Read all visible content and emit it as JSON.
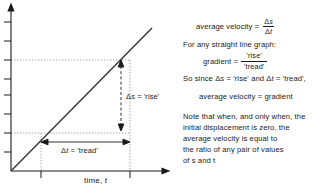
{
  "graph": {
    "x_axis_label": "time, ",
    "x_axis_label_var": "t",
    "rise_annotation_pre": "Δ",
    "rise_annotation_var": "s",
    "rise_annotation_post": " = 'rise'",
    "tread_annotation_pre": "Δ",
    "tread_annotation_var": "t",
    "tread_annotation_post": " = 'tread'",
    "line_color": "#3a3a3a",
    "axis_color": "#1a1a1a",
    "guide_color": "#9a9a9a",
    "background": "#ffffff"
  },
  "text_panel": {
    "avg_velocity_label": "average velocity =",
    "avg_velocity_numerator_delta": "Δ",
    "avg_velocity_numerator_var": "s",
    "avg_velocity_denominator_delta": "Δ",
    "avg_velocity_denominator_var": "t",
    "for_any_line": "For any straight line graph:",
    "gradient_label": "gradient =",
    "gradient_numerator": "'rise'",
    "gradient_denominator": "'tread'",
    "so_since_pre": "So since ",
    "so_since_delta1": "Δ",
    "so_since_var1": "s",
    "so_since_mid": " = 'rise' and ",
    "so_since_delta2": "Δ",
    "so_since_var2": "t",
    "so_since_post": " = 'tread',",
    "avg_velocity_gradient": "average velocity = gradient",
    "note_lines": [
      "Note that when, and only when, the",
      "initial displacement is zero, the",
      "average velocity is equal to",
      "the ratio of any pair of values",
      "of s and t"
    ]
  }
}
